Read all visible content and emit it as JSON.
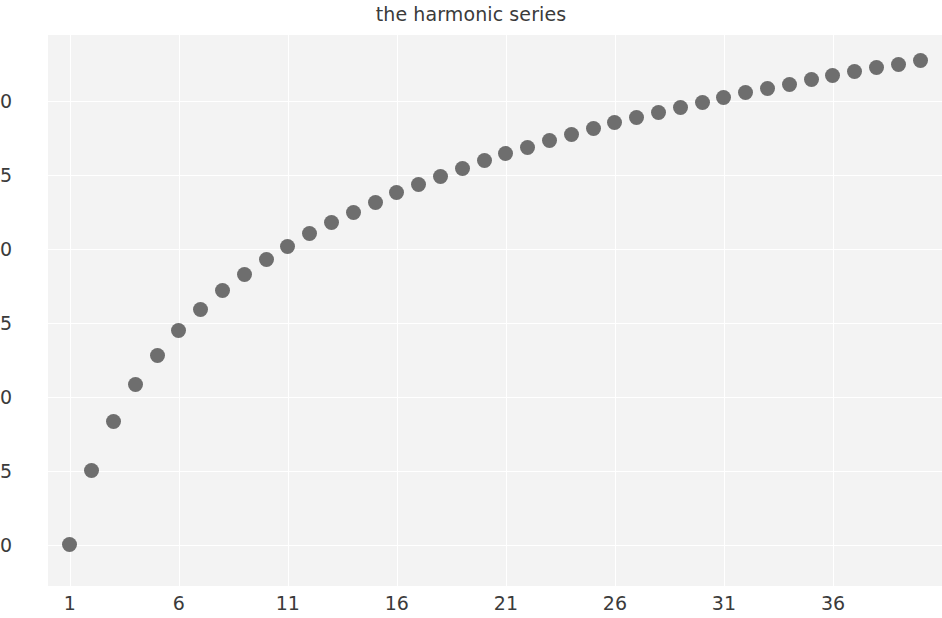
{
  "chart": {
    "title": "the harmonic series",
    "xlabel": "",
    "ylabel": ""
  },
  "colors": {
    "marker": "#6e6e6e",
    "plot_background": "#f3f3f3",
    "figure_background": "#ffffff",
    "grid": "#ffffff",
    "tick_text": "#3b3b3b",
    "title_text": "#3b3b3b"
  },
  "chart_data": {
    "type": "scatter",
    "title": "the harmonic series",
    "xlabel": "",
    "ylabel": "",
    "xlim": [
      0.0,
      41.0
    ],
    "ylim": [
      0.72,
      4.45
    ],
    "grid": true,
    "legend": null,
    "xticks": [
      1,
      6,
      11,
      16,
      21,
      26,
      31,
      36
    ],
    "xtick_labels": [
      "1",
      "6",
      "11",
      "16",
      "21",
      "26",
      "31",
      "36"
    ],
    "yticks": [
      1.0,
      1.5,
      2.0,
      2.5,
      3.0,
      3.5,
      4.0
    ],
    "ytick_labels": [
      "1.0",
      "1.5",
      "2.0",
      "2.5",
      "3.0",
      "3.5",
      "4.0"
    ],
    "series": [
      {
        "name": "partial sums H(n)",
        "x": [
          1,
          2,
          3,
          4,
          5,
          6,
          7,
          8,
          9,
          10,
          11,
          12,
          13,
          14,
          15,
          16,
          17,
          18,
          19,
          20,
          21,
          22,
          23,
          24,
          25,
          26,
          27,
          28,
          29,
          30,
          31,
          32,
          33,
          34,
          35,
          36,
          37,
          38,
          39,
          40
        ],
        "values": [
          1.0,
          1.5,
          1.8333,
          2.0833,
          2.2833,
          2.45,
          2.5929,
          2.7179,
          2.829,
          2.929,
          3.0199,
          3.1032,
          3.1801,
          3.2516,
          3.3182,
          3.3807,
          3.4396,
          3.4951,
          3.5477,
          3.5977,
          3.6454,
          3.691,
          3.7343,
          3.776,
          3.816,
          3.8544,
          3.8915,
          3.9272,
          3.9617,
          3.995,
          4.0272,
          4.0585,
          4.0888,
          4.1182,
          4.1468,
          4.1746,
          4.2016,
          4.2279,
          4.2535,
          4.2785
        ]
      }
    ]
  }
}
